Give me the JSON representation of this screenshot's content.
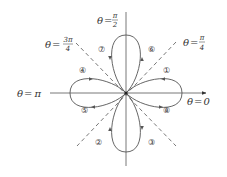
{
  "figure": {
    "colors": {
      "curve": "#555555",
      "axis": "#555555",
      "dashed": "#555555",
      "text": "#333333",
      "background": "#ffffff"
    },
    "angle_labels": {
      "theta_0": {
        "lhs": "θ",
        "eq": "=",
        "value": "0"
      },
      "theta_pi": {
        "lhs": "θ",
        "eq": "=",
        "value": "π"
      },
      "theta_pi_2": {
        "lhs": "θ",
        "eq": "=",
        "num": "π",
        "den": "2"
      },
      "theta_pi_4": {
        "lhs": "θ",
        "eq": "=",
        "num": "π",
        "den": "4"
      },
      "theta_3pi_4": {
        "lhs": "θ",
        "eq": "=",
        "num": "3π",
        "den": "4"
      }
    },
    "loop_order_labels": {
      "l1": "①",
      "l2": "②",
      "l3": "③",
      "l4": "④",
      "l5": "⑤",
      "l6": "⑥",
      "l7": "⑦",
      "l8": "⑧"
    },
    "petals": [
      "right",
      "top",
      "left",
      "bottom"
    ],
    "dashed_lines": [
      "θ = π/4",
      "θ = 3π/4"
    ]
  }
}
